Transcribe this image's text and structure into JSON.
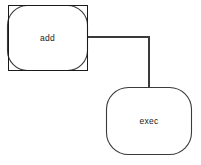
{
  "canvas": {
    "width": 201,
    "height": 165,
    "background": "#ffffff",
    "stroke_color": "#3a3a3a",
    "selection_color": "#1a1a1a",
    "label_color": "#1a1a1a"
  },
  "diagram": {
    "type": "node-graph",
    "nodes": [
      {
        "id": "add",
        "label": "add",
        "shape": "rounded-rectangle",
        "selected": true,
        "x": 7,
        "y": 5,
        "width": 81,
        "height": 66,
        "corner_radius": 20,
        "selection_box": {
          "x": 8,
          "y": 5,
          "width": 80,
          "height": 66
        }
      },
      {
        "id": "exec",
        "label": "exec",
        "shape": "rounded-rectangle",
        "selected": false,
        "x": 106,
        "y": 87,
        "width": 86,
        "height": 68,
        "corner_radius": 22
      }
    ],
    "edges": [
      {
        "id": "add-to-exec",
        "from": "add",
        "to": "exec",
        "style": "orthogonal",
        "points": [
          {
            "x": 88,
            "y": 37
          },
          {
            "x": 149,
            "y": 37
          },
          {
            "x": 149,
            "y": 87
          }
        ]
      }
    ]
  }
}
